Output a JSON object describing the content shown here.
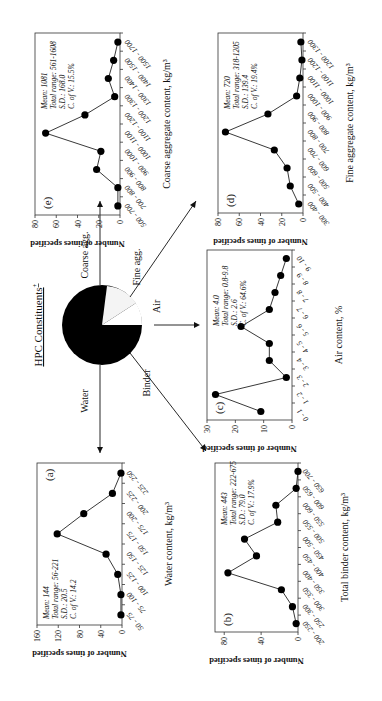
{
  "figure": {
    "title": "HPC Constituents",
    "title_superscript": "+",
    "pie_labels": [
      "Water",
      "Coarse agg.",
      "Fine agg.",
      "Air",
      "Binder"
    ]
  },
  "chart_data": [
    {
      "id": "a",
      "type": "line",
      "panel_label": "(a)",
      "categories": [
        "50 - 75",
        "75 - 100",
        "100 - 125",
        "125 - 150",
        "150 - 175",
        "175 - 200",
        "200 - 225",
        "225 - 250"
      ],
      "values": [
        2,
        2,
        8,
        30,
        122,
        72,
        18,
        2
      ],
      "xlabel": "Water content, kg/m³",
      "ylabel": "Number of times specified",
      "yticks": [
        0,
        40,
        80,
        120,
        160
      ],
      "ylim": [
        0,
        160
      ],
      "stats": [
        "Mean: 144",
        "Total range: 56-221",
        "S.D.: 20.5",
        "C. of V.: 14.2"
      ]
    },
    {
      "id": "b",
      "type": "line",
      "panel_label": "(b)",
      "categories": [
        "200 - 250",
        "250 - 300",
        "300 - 350",
        "350 - 400",
        "400 - 450",
        "450 - 500",
        "500 - 550",
        "550 - 600",
        "600 - 650",
        "650 - 700"
      ],
      "values": [
        2,
        6,
        18,
        76,
        45,
        58,
        22,
        24,
        2,
        0
      ],
      "xlabel": "Total binder content, kg/m³",
      "ylabel": "Number of times specified",
      "yticks": [
        0,
        40,
        80
      ],
      "ylim": [
        0,
        90
      ],
      "stats": [
        "Mean: 443",
        "Total range: 222-675",
        "S.D.: 79.0",
        "C. of V.: 17.9%"
      ]
    },
    {
      "id": "c",
      "type": "line",
      "panel_label": "(c)",
      "categories": [
        "0 - 1",
        "1 - 2",
        "2 - 3",
        "3 - 4",
        "4 - 5",
        "5 - 6",
        "6 - 7",
        "7 - 8",
        "8 - 9",
        "9 - 10"
      ],
      "values": [
        11,
        27,
        2,
        8,
        8,
        18,
        8,
        6,
        4,
        2
      ],
      "xlabel": "Air content, %",
      "ylabel": "Number of times specified",
      "yticks": [
        0,
        10,
        20,
        30
      ],
      "ylim": [
        0,
        30
      ],
      "stats": [
        "Mean: 4.0",
        "Total range: 0.8-9.8",
        "S.D.: 2.6",
        "C. of V.: 64.6%"
      ]
    },
    {
      "id": "d",
      "type": "line",
      "panel_label": "(d)",
      "categories": [
        "300 - 400",
        "400 - 500",
        "500 - 600",
        "600 - 700",
        "700 - 800",
        "800 - 900",
        "900 - 1000",
        "1000 - 1100",
        "1100 - 1200",
        "1200 - 1300"
      ],
      "values": [
        4,
        12,
        15,
        27,
        73,
        33,
        6,
        3,
        1,
        2
      ],
      "xlabel": "Fine aggregate content, kg/m³",
      "ylabel": "Number of times specified",
      "yticks": [
        0,
        20,
        40,
        60,
        80
      ],
      "ylim": [
        0,
        80
      ],
      "stats": [
        "Mean: 720",
        "Total range: 318-1205",
        "S.D.: 139.4",
        "C. of V.: 19.4%"
      ]
    },
    {
      "id": "e",
      "type": "line",
      "panel_label": "(e)",
      "categories": [
        "500 - 700",
        "700 - 800",
        "800 - 900",
        "900 - 1000",
        "1000 - 1100",
        "1100 - 1200",
        "1200 - 1300",
        "1300 - 1400",
        "1400 - 1500",
        "1500 - 1700"
      ],
      "values": [
        2,
        2,
        22,
        18,
        70,
        33,
        5,
        11,
        6,
        2
      ],
      "xlabel": "Coarse aggregate content, kg/m³",
      "ylabel": "Number of times specified",
      "yticks": [
        0,
        20,
        40,
        60,
        80
      ],
      "ylim": [
        0,
        80
      ],
      "stats": [
        "Mean: 1081",
        "Total range: 561-1608",
        "S.D.: 168.0",
        "C. of V.: 15.5%"
      ]
    }
  ],
  "layout": {
    "orientation": "rotated -90deg",
    "panels": {
      "a": {
        "x": 76,
        "y": 37,
        "w": 162,
        "h": 85
      },
      "b": {
        "x": 69,
        "y": 215,
        "w": 169,
        "h": 83
      },
      "c": {
        "x": 281,
        "y": 207,
        "w": 170,
        "h": 85
      },
      "d": {
        "x": 488,
        "y": 218,
        "w": 180,
        "h": 85
      },
      "e": {
        "x": 486,
        "y": 35,
        "w": 182,
        "h": 85
      }
    }
  }
}
